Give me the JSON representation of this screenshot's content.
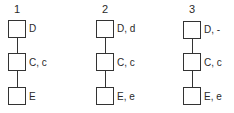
{
  "pedigrees": [
    {
      "number": "1",
      "generations": [
        {
          "label": "D"
        },
        {
          "label": "C, c"
        },
        {
          "label": "E"
        }
      ]
    },
    {
      "number": "2",
      "generations": [
        {
          "label": "D, d"
        },
        {
          "label": "C, c"
        },
        {
          "label": "E, e"
        }
      ]
    },
    {
      "number": "3",
      "generations": [
        {
          "label": "D, -"
        },
        {
          "label": "C, c"
        },
        {
          "label": "E, e"
        }
      ]
    }
  ]
}
